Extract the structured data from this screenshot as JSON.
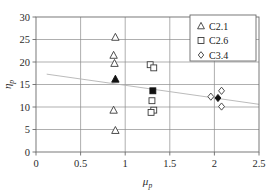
{
  "chart_data": {
    "type": "scatter",
    "title": "",
    "xlabel": "μ_p",
    "ylabel": "η_p",
    "xlabel_base": "μ",
    "xlabel_sub": "p",
    "ylabel_base": "η",
    "ylabel_sub": "p",
    "xlim": [
      0,
      2.5
    ],
    "ylim": [
      0,
      30
    ],
    "xticks": [
      "0",
      "0.5",
      "1",
      "1.5",
      "2",
      "2.5"
    ],
    "xtick_values": [
      0,
      0.5,
      1,
      1.5,
      2,
      2.5
    ],
    "yticks": [
      "0",
      "5",
      "10",
      "15",
      "20",
      "25",
      "30"
    ],
    "ytick_values": [
      0,
      5,
      10,
      15,
      20,
      25,
      30
    ],
    "grid": true,
    "legend_position": "top-right",
    "series": [
      {
        "name": "C2.1",
        "marker": "triangle",
        "fill": "open",
        "points": [
          {
            "x": 0.89,
            "y": 25.5
          },
          {
            "x": 0.87,
            "y": 21.5
          },
          {
            "x": 0.88,
            "y": 19.7
          },
          {
            "x": 0.87,
            "y": 9.3
          },
          {
            "x": 0.89,
            "y": 4.8
          }
        ]
      },
      {
        "name": "C2.1-mean",
        "marker": "triangle",
        "fill": "filled",
        "points": [
          {
            "x": 0.89,
            "y": 16.2
          }
        ]
      },
      {
        "name": "C2.6",
        "marker": "square",
        "fill": "open",
        "points": [
          {
            "x": 1.28,
            "y": 19.4
          },
          {
            "x": 1.32,
            "y": 18.7
          },
          {
            "x": 1.3,
            "y": 11.4
          },
          {
            "x": 1.32,
            "y": 9.3
          },
          {
            "x": 1.29,
            "y": 8.8
          }
        ]
      },
      {
        "name": "C2.6-mean",
        "marker": "square",
        "fill": "filled",
        "points": [
          {
            "x": 1.31,
            "y": 13.6
          }
        ]
      },
      {
        "name": "C3.4",
        "marker": "diamond",
        "fill": "open",
        "points": [
          {
            "x": 2.08,
            "y": 13.6
          },
          {
            "x": 1.96,
            "y": 12.3
          },
          {
            "x": 2.08,
            "y": 10.1
          }
        ]
      },
      {
        "name": "C3.4-mean",
        "marker": "diamond",
        "fill": "filled",
        "points": [
          {
            "x": 2.04,
            "y": 12.0
          }
        ]
      }
    ],
    "trendline": {
      "x1": 0.12,
      "y1": 17.3,
      "x2": 2.5,
      "y2": 10.6,
      "color": "#b3b3b3"
    },
    "annotations": []
  },
  "legend": {
    "entries": [
      {
        "label": "C2.1",
        "marker": "triangle"
      },
      {
        "label": "C2.6",
        "marker": "square"
      },
      {
        "label": "C3.4",
        "marker": "diamond"
      }
    ]
  },
  "colors": {
    "marker_stroke": "#3a3a3a",
    "marker_fill_open": "#ffffff",
    "marker_fill_solid": "#111111",
    "grid": "#8c8c8c",
    "frame": "#6b6b6b",
    "trend": "#b3b3b3",
    "text": "#1a1a1a"
  }
}
